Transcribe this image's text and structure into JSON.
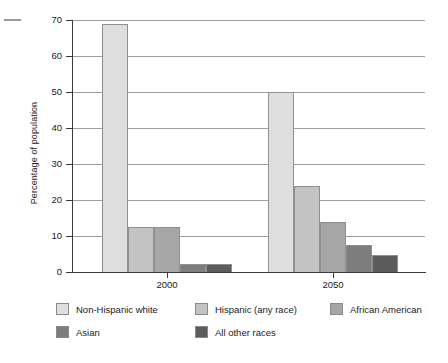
{
  "chart_data": {
    "type": "bar",
    "title": "",
    "xlabel": "",
    "ylabel": "Percentage of population",
    "ylim": [
      0,
      70
    ],
    "yticks": [
      0,
      10,
      20,
      30,
      40,
      50,
      60,
      70
    ],
    "ytick_labels": [
      "0",
      "10",
      "20",
      "30",
      "40",
      "50",
      "60",
      "70"
    ],
    "grid": true,
    "legend_position": "bottom",
    "categories": [
      "2000",
      "2050"
    ],
    "series": [
      {
        "name": "Non-Hispanic white",
        "color": "#dedede",
        "values": [
          69,
          50
        ]
      },
      {
        "name": "Hispanic (any race)",
        "color": "#c3c3c3",
        "values": [
          12.5,
          23.8
        ]
      },
      {
        "name": "African  American",
        "color": "#a6a6a6",
        "values": [
          12.5,
          14
        ]
      },
      {
        "name": "Asian",
        "color": "#7d7d7d",
        "values": [
          2.3,
          7.5
        ]
      },
      {
        "name": "All other races",
        "color": "#5c5c5c",
        "values": [
          2.3,
          4.7
        ]
      }
    ]
  },
  "axis": {
    "y_title": "Percentage of population",
    "y_labels": [
      "70",
      "60",
      "50",
      "40",
      "30",
      "20",
      "10",
      "0"
    ],
    "x_labels": [
      "2000",
      "2050"
    ]
  },
  "legend": {
    "items": [
      {
        "label": "Non-Hispanic white",
        "color": "#dedede"
      },
      {
        "label": "Hispanic (any race)",
        "color": "#c3c3c3"
      },
      {
        "label": "African  American",
        "color": "#a6a6a6"
      },
      {
        "label": "Asian",
        "color": "#7d7d7d"
      },
      {
        "label": "All other races",
        "color": "#5c5c5c"
      }
    ]
  }
}
